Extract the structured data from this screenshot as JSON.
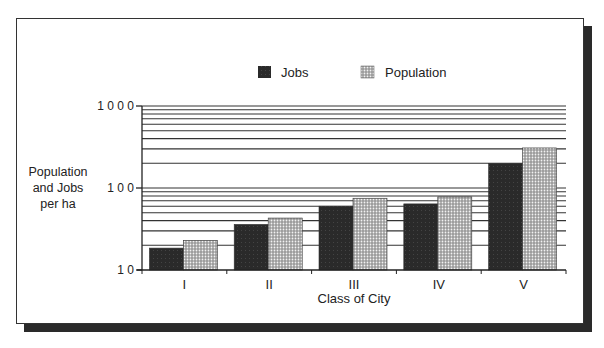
{
  "chart_data": {
    "type": "bar",
    "title": "",
    "xlabel": "Class of City",
    "ylabel": "Population and Jobs per ha",
    "ylabel_lines": [
      "Population",
      "and Jobs",
      "per ha"
    ],
    "yscale": "log",
    "ylim": [
      10,
      1000
    ],
    "yticks": [
      10,
      100,
      1000
    ],
    "ytick_labels": [
      "1 0",
      "1 0 0",
      "1 0 0 0"
    ],
    "grid": true,
    "legend_position": "top-center",
    "categories": [
      "I",
      "II",
      "III",
      "IV",
      "V"
    ],
    "series": [
      {
        "name": "Jobs",
        "pattern": "solid-dark",
        "color": "#2b2b2b",
        "values": [
          18.5,
          36,
          60,
          64,
          200
        ]
      },
      {
        "name": "Population",
        "pattern": "dotted",
        "color": "#8a8a8a",
        "values": [
          23,
          43,
          75,
          78,
          308
        ]
      }
    ]
  },
  "legend": {
    "items": [
      {
        "label": "Jobs"
      },
      {
        "label": "Population"
      }
    ]
  }
}
